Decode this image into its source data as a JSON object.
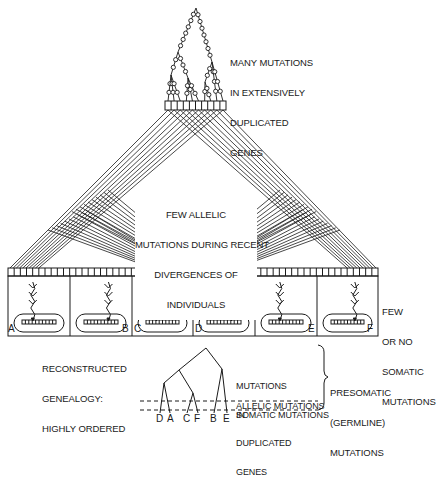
{
  "figure": {
    "top_label": [
      "MANY MUTATIONS",
      "IN EXTENSIVELY",
      "DUPLICATED",
      "GENES"
    ],
    "center_label": [
      "FEW ALLELIC",
      "MUTATIONS DURING RECENT",
      "DIVERGENCES OF",
      "INDIVIDUALS"
    ],
    "right_label": [
      "FEW",
      "OR NO",
      "SOMATIC",
      "MUTATIONS"
    ],
    "genealogy_label": [
      "RECONSTRUCTED",
      "GENEALOGY:",
      "HIGHLY ORDERED"
    ],
    "individuals": [
      "A",
      "B",
      "C",
      "D",
      "E",
      "F"
    ],
    "tree_leaves": [
      "D",
      "A",
      "C",
      "F",
      "B",
      "E"
    ],
    "tree_labels": {
      "duplicated": [
        "MUTATIONS",
        "IN",
        "DUPLICATED",
        "GENES"
      ],
      "allelic": "ALLELIC MUTATIONS",
      "somatic": "SOMATIC MUTATIONS"
    },
    "brace_label": [
      "PRESOMATIC",
      "(GERMLINE)",
      "MUTATIONS"
    ]
  },
  "colors": {
    "ink": "#1a1a1a",
    "background": "#ffffff"
  }
}
